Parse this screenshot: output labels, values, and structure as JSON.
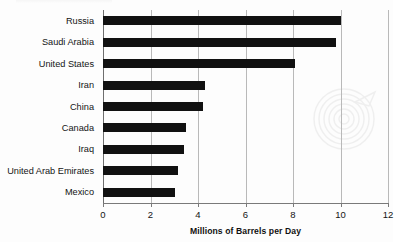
{
  "chart_data": {
    "type": "bar",
    "orientation": "horizontal",
    "title": "",
    "subtitle": "",
    "xlabel": "Millions of Barrels per Day",
    "ylabel": "",
    "categories": [
      "Russia",
      "Saudi Arabia",
      "United States",
      "Iran",
      "China",
      "Canada",
      "Iraq",
      "United Arab Emirates",
      "Mexico"
    ],
    "values": [
      10.0,
      9.8,
      8.1,
      4.3,
      4.2,
      3.5,
      3.4,
      3.15,
      3.05
    ],
    "xlim": [
      0,
      12
    ],
    "xticks": [
      0,
      2,
      4,
      6,
      8,
      10,
      12
    ],
    "xtick_labels": [
      "0",
      "2",
      "4",
      "6",
      "8",
      "10",
      "12"
    ],
    "grid": "vertical",
    "legend": "none",
    "bar_color": "#111111",
    "gridline_color": "#b9b9b9",
    "axis_color": "#7a7a7a",
    "background_color": "#fdfdfd"
  },
  "watermark": {
    "name": "concentric-spiral-watermark",
    "color": "#d8d8d8"
  }
}
